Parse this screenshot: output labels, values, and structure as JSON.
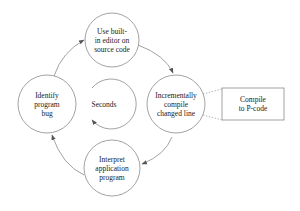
{
  "diagram": {
    "type": "cycle",
    "colors": {
      "stroke": "#8a8a8a",
      "text": "#1a1a1a",
      "background": "#ffffff"
    },
    "nodes": [
      {
        "id": "edit",
        "lines": [
          "Use built-",
          "in editor on",
          "source code"
        ]
      },
      {
        "id": "compile",
        "lines": [
          "Incrementally",
          "compile",
          "changed line"
        ]
      },
      {
        "id": "interpret",
        "lines": [
          "Interpret",
          "application",
          "program"
        ]
      },
      {
        "id": "identify",
        "lines": [
          "Identify",
          "program",
          "bug"
        ]
      }
    ],
    "center_label": "Seconds",
    "side_box": {
      "lines": [
        "Compile",
        "to P-code"
      ],
      "attached_to": "compile"
    },
    "edges": [
      {
        "from": "identify",
        "to": "edit"
      },
      {
        "from": "edit",
        "to": "compile"
      },
      {
        "from": "compile",
        "to": "interpret"
      },
      {
        "from": "interpret",
        "to": "identify"
      }
    ]
  }
}
